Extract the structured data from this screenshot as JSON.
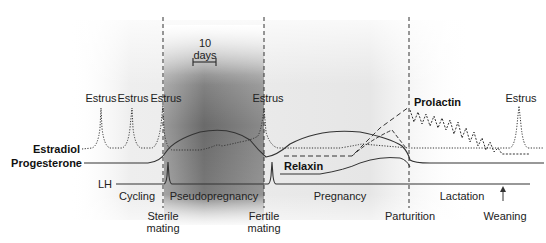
{
  "diagram": {
    "type": "hormone-timeline",
    "scale_bar": {
      "value": "10",
      "unit": "days"
    },
    "hormone_labels": {
      "estradiol": "Estradiol",
      "progesterone": "Progesterone",
      "lh": "LH",
      "relaxin": "Relaxin",
      "prolactin": "Prolactin"
    },
    "estrus_labels": [
      "Estrus",
      "Estrus",
      "Estrus",
      "Estrus",
      "Estrus"
    ],
    "phases": {
      "cycling": "Cycling",
      "pseudopregnancy": "Pseudopregnancy",
      "pregnancy": "Pregnancy",
      "lactation": "Lactation"
    },
    "events": {
      "sterile_mating_1": "Sterile",
      "sterile_mating_2": "mating",
      "fertile_mating_1": "Fertile",
      "fertile_mating_2": "mating",
      "parturition": "Parturition",
      "weaning": "Weaning"
    },
    "colors": {
      "line": "#333333",
      "shade_dark": "#6e6e6e",
      "shade_light": "#e6e6e6",
      "background": "#ffffff"
    }
  }
}
